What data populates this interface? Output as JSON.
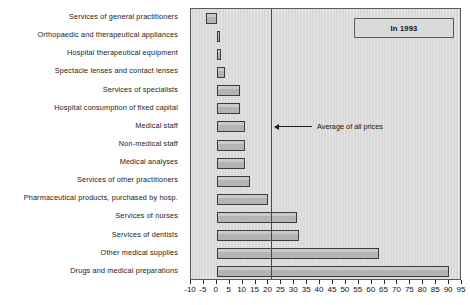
{
  "legend": {
    "text": "In 1993"
  },
  "annotation": {
    "text": "Average of all prices",
    "value": 21
  },
  "axis": {
    "ticks": [
      -10,
      -5,
      0,
      5,
      10,
      15,
      20,
      25,
      30,
      35,
      40,
      45,
      50,
      55,
      60,
      65,
      70,
      75,
      80,
      85,
      90,
      95
    ],
    "tick_labels": [
      "-10",
      "-5",
      "0",
      "5",
      "10",
      "15",
      "20",
      "25",
      "30",
      "35",
      "40",
      "45",
      "50",
      "55",
      "60",
      "65",
      "70",
      "75",
      "80",
      "85",
      "90",
      "95"
    ]
  },
  "chart_data": {
    "type": "bar",
    "orientation": "horizontal",
    "title": "",
    "subtitle": "",
    "xlabel": "",
    "ylabel": "",
    "xlim": [
      -10,
      95
    ],
    "grid": false,
    "legend_position": "top-right",
    "legend_entries": [
      "In 1993"
    ],
    "annotations": [
      {
        "text": "Average of all prices",
        "x": 21,
        "type": "vertical-reference-line-with-arrow"
      }
    ],
    "categories": [
      "Services of general practitioners",
      "Orthopaedic and therapeutical appliances",
      "Hospital therapeutical equipment",
      "Spectacle lenses and contact lenses",
      "Services of specialists",
      "Hospital consumption of fixed capital",
      "Medical  staff",
      "Non-medical staff",
      "Medical analyses",
      "Services of other practitioners",
      "Pharmaceutical products, purchased by hosp.",
      "Services of nurses",
      "Services of dentists",
      "Other medical supplies",
      "Drugs and medical preparations"
    ],
    "values": [
      -4,
      1,
      1.5,
      3,
      9,
      9,
      11,
      11,
      11,
      13,
      20,
      31,
      32,
      63,
      90
    ],
    "bar_color": "#b4b4b4",
    "bar_border_color": "#3c3c3c",
    "plot_background": "#d9d9d9"
  }
}
